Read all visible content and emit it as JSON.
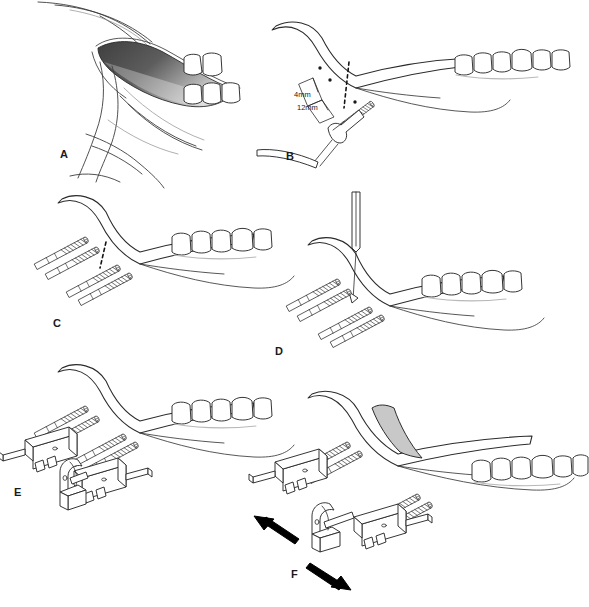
{
  "figure": {
    "background_color": "#ffffff",
    "ink_color": "#2b2b2b",
    "width": 589,
    "height": 607
  },
  "panels": [
    {
      "letter": "A",
      "name": "panel-a",
      "caption": "Intraoral exposure of mandibular ramus with shaded surgical site",
      "letter_x": 60,
      "letter_y": 158,
      "shading": {
        "type": "gradient",
        "from": "#4a4a4a",
        "to": "#d4d4d4"
      },
      "labels": []
    },
    {
      "letter": "B",
      "name": "panel-b",
      "caption": "Pin placement with drill, showing 4mm and 12mm measurements and dashed osteotomy line",
      "letter_x": 286,
      "letter_y": 160,
      "labels": [
        {
          "text": "4mm",
          "x": 297,
          "y": 94
        },
        {
          "text": "12mm",
          "x": 300,
          "y": 107
        }
      ]
    },
    {
      "letter": "C",
      "name": "panel-c",
      "caption": "Four threaded pins placed in two pairs flanking the dashed osteotomy line",
      "letter_x": 53,
      "letter_y": 327,
      "labels": []
    },
    {
      "letter": "D",
      "name": "panel-d",
      "caption": "Osteotomy performed with reciprocating saw blade between pin pairs",
      "letter_x": 275,
      "letter_y": 355,
      "labels": []
    },
    {
      "letter": "E",
      "name": "panel-e",
      "caption": "External distractor device clamped onto both pin pairs",
      "letter_x": 14,
      "letter_y": 496,
      "labels": []
    },
    {
      "letter": "F",
      "name": "panel-f",
      "caption": "Active distraction with bidirectional arrows and regenerate bone in the gap",
      "letter_x": 291,
      "letter_y": 578,
      "regenerate_color": "#c8c8c8",
      "labels": []
    }
  ],
  "annotations": {
    "measurement_4mm": "4mm",
    "measurement_12mm": "12mm",
    "arrow_count": 2,
    "arrow_color": "#000000",
    "arrow_meaning": "distraction direction"
  }
}
